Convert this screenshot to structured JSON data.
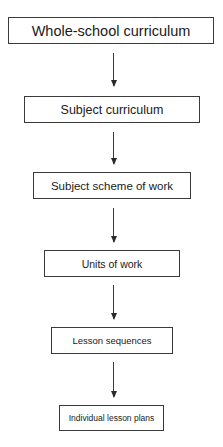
{
  "diagram": {
    "type": "flowchart",
    "direction": "top-to-bottom",
    "nodes": [
      {
        "id": "n1",
        "label": "Whole-school curriculum"
      },
      {
        "id": "n2",
        "label": "Subject curriculum"
      },
      {
        "id": "n3",
        "label": "Subject scheme of work"
      },
      {
        "id": "n4",
        "label": "Units of work"
      },
      {
        "id": "n5",
        "label": "Lesson sequences"
      },
      {
        "id": "n6",
        "label": "Individual lesson plans"
      }
    ],
    "edges": [
      {
        "from": "n1",
        "to": "n2"
      },
      {
        "from": "n2",
        "to": "n3"
      },
      {
        "from": "n3",
        "to": "n4"
      },
      {
        "from": "n4",
        "to": "n5"
      },
      {
        "from": "n5",
        "to": "n6"
      }
    ]
  }
}
